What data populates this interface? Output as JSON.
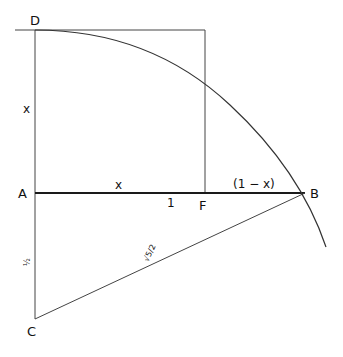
{
  "diagram": {
    "colors": {
      "line": "#333333",
      "base": "#1a1a1a",
      "background": "#ffffff"
    },
    "points": {
      "D": {
        "label": "D",
        "x": 35,
        "y": 30
      },
      "A": {
        "label": "A",
        "x": 35,
        "y": 193
      },
      "B": {
        "label": "B",
        "x": 305,
        "y": 193
      },
      "C": {
        "label": "C",
        "x": 35,
        "y": 319
      },
      "F": {
        "label": "F",
        "x": 205,
        "y": 193
      }
    },
    "segment_labels": {
      "AD": "x",
      "AF": "x",
      "AB": "1",
      "FB": "(1 − x)",
      "AC": "½",
      "CB": "√5/2"
    }
  }
}
